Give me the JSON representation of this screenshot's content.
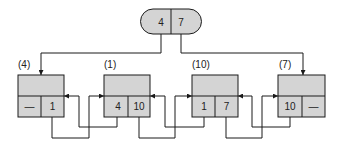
{
  "diagram": {
    "header": {
      "first": "4",
      "last": "7"
    },
    "nodes": [
      {
        "label": "(4)",
        "prev": "—",
        "next": "1"
      },
      {
        "label": "(1)",
        "prev": "4",
        "next": "10"
      },
      {
        "label": "(10)",
        "prev": "1",
        "next": "7"
      },
      {
        "label": "(7)",
        "prev": "10",
        "next": "—"
      }
    ],
    "colors": {
      "fill": "#d4d4d4",
      "stroke": "#1a1a1a",
      "background": "#ffffff"
    }
  }
}
